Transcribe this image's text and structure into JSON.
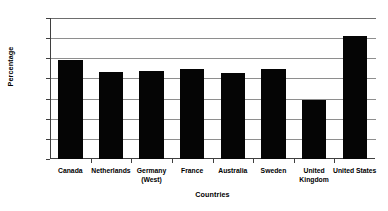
{
  "chart_data": {
    "type": "bar",
    "title": "",
    "xlabel": "Countries",
    "ylabel": "Percentage",
    "categories": [
      "Canada",
      "Netherlands",
      "Germany\n(West)",
      "France",
      "Australia",
      "Sweden",
      "United\nKingdom",
      "United States"
    ],
    "values": [
      9.8,
      8.6,
      8.7,
      8.9,
      8.5,
      8.9,
      5.9,
      12.2
    ],
    "ylim": [
      0,
      14
    ],
    "ytick_step": 2,
    "yticks": [
      0,
      2,
      4,
      6,
      8,
      10,
      12,
      14
    ],
    "ytick_labels": [
      "0",
      "2",
      "4",
      "6",
      "8",
      "10",
      "12",
      "14"
    ],
    "grid": true,
    "grid_axis": "y",
    "legend": false,
    "legend_position": "none",
    "bar_color": "#050505",
    "grid_color": "#8e8e8e",
    "axis_color": "#3f3f3f",
    "background_color": "#ffffff"
  }
}
